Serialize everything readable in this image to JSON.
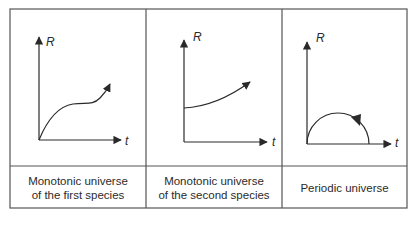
{
  "diagram": {
    "panels": [
      {
        "id": "monotonic-first",
        "y_axis_label": "R",
        "x_axis_label": "t",
        "curve": "monotonic increasing with inflection (rises, flattens, rises again)",
        "caption_line1": "Monotonic universe",
        "caption_line2": "of the first species"
      },
      {
        "id": "monotonic-second",
        "y_axis_label": "R",
        "x_axis_label": "t",
        "curve": "starts at nonzero R, increases monotonically",
        "caption_line1": "Monotonic universe",
        "caption_line2": "of the second species"
      },
      {
        "id": "periodic",
        "y_axis_label": "R",
        "x_axis_label": "t",
        "curve": "semicircular arc from origin back to zero",
        "caption_line1": "Periodic universe",
        "caption_line2": ""
      }
    ],
    "colors": {
      "line": "#333333",
      "border": "#555555",
      "background": "#ffffff"
    }
  }
}
